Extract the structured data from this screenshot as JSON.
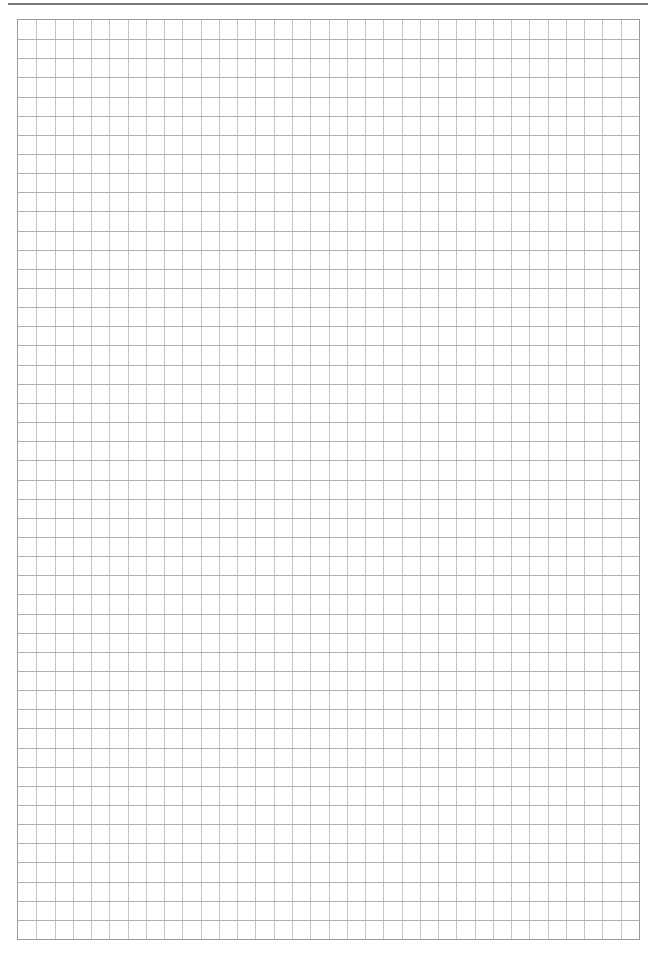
{
  "page": {
    "background": "#ffffff",
    "header": {
      "text_visible": false,
      "rule_color": "#7a7a7a"
    },
    "grid": {
      "columns": 34,
      "rows": 48,
      "left": 17,
      "top": 19,
      "width": 623,
      "height": 921,
      "line_color_vertical": "#c4c4c4",
      "line_color_horizontal": "#b0b0b0",
      "border_color": "#9a9a9a"
    }
  }
}
